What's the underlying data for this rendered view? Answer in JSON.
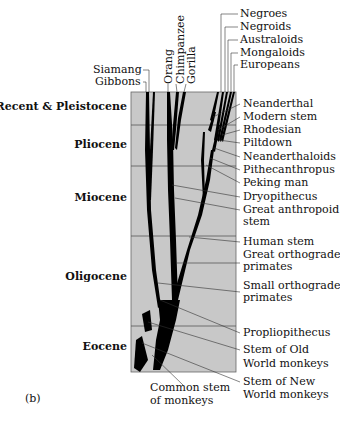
{
  "figure": {
    "panel_label": "(b)",
    "colors": {
      "chart_bg": "#c8c8c8",
      "branch": "#000000",
      "leader": "#333333",
      "divider": "#555555"
    }
  },
  "eras": [
    {
      "label": "Recent & Pleistocene"
    },
    {
      "label": "Pliocene"
    },
    {
      "label": "Miocene"
    },
    {
      "label": "Oligocene"
    },
    {
      "label": "Eocene"
    }
  ],
  "top_labels": {
    "siamang": "Siamang",
    "gibbons": "Gibbons",
    "orang": "Orang",
    "chimpanzee": "Chimpanzee",
    "gorilla": "Gorilla"
  },
  "human_labels": [
    {
      "label": "Negroes"
    },
    {
      "label": "Negroids"
    },
    {
      "label": "Australoids"
    },
    {
      "label": "Mongaloids"
    },
    {
      "label": "Europeans"
    }
  ],
  "right_labels": [
    {
      "label": "Neanderthal"
    },
    {
      "label": "Modern stem"
    },
    {
      "label": "Rhodesian"
    },
    {
      "label": "Piltdown"
    },
    {
      "label": "Neanderthaloids"
    },
    {
      "label": "Pithecanthropus"
    },
    {
      "label": "Peking man"
    },
    {
      "label": "Dryopithecus"
    },
    {
      "label": "Great anthropoid"
    },
    {
      "label": "stem"
    },
    {
      "label": "Human stem"
    },
    {
      "label": "Great orthograde"
    },
    {
      "label": "primates"
    },
    {
      "label": "Small orthograde"
    },
    {
      "label": "primates"
    },
    {
      "label": "Propliopithecus"
    },
    {
      "label": "Stem of Old"
    },
    {
      "label": "World monkeys"
    },
    {
      "label": "Stem of New"
    },
    {
      "label": "World monkeys"
    }
  ],
  "bottom_label": {
    "line1": "Common stem",
    "line2": "of monkeys"
  }
}
